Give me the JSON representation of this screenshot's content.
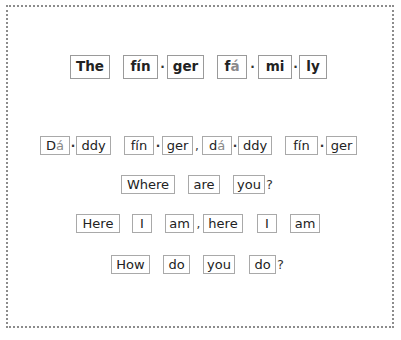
{
  "title_line": {
    "words": [
      {
        "syllables": [
          "The"
        ]
      },
      {
        "syllables": [
          "fín",
          "ger"
        ]
      },
      {
        "syllables": [
          "fá",
          "mi",
          "ly"
        ]
      }
    ],
    "text": "The fin-ger fa-mi-ly"
  },
  "lines": [
    {
      "text": "Dá-ddy fín-ger, dá-ddy fín-ger",
      "syllables": [
        "Dá",
        "ddy",
        "fín",
        "ger",
        "dá",
        "ddy",
        "fín",
        "ger"
      ]
    },
    {
      "text": "Where are you?",
      "syllables": [
        "Where",
        "are",
        "you"
      ],
      "end_punct": "?"
    },
    {
      "text": "Here I am, here I am",
      "syllables": [
        "Here",
        "I",
        "am",
        "here",
        "I",
        "am"
      ]
    },
    {
      "text": "How do you do?",
      "syllables": [
        "How",
        "do",
        "you",
        "do"
      ],
      "end_punct": "?"
    }
  ],
  "symbols": {
    "syllable_separator": "·",
    "comma": ",",
    "question": "?"
  },
  "colors": {
    "border": "#8c8c8c",
    "box_border": "#a9a9a9",
    "text": "#222222",
    "accent_vowel": "#8a8a8a"
  }
}
